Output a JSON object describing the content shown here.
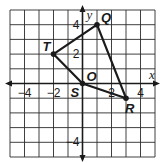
{
  "diagram": {
    "type": "coordinate-grid",
    "grid": {
      "xmin": -5,
      "xmax": 5,
      "ymin": -5,
      "ymax": 5,
      "step": 1
    },
    "axes": {
      "x_label": "x",
      "y_label": "y",
      "origin_label": "O"
    },
    "ticks": {
      "x": [
        {
          "value": -4,
          "label": "−4"
        },
        {
          "value": -2,
          "label": "−2"
        },
        {
          "value": 2,
          "label": "2"
        },
        {
          "value": 4,
          "label": "4"
        }
      ],
      "y": [
        {
          "value": 4,
          "label": "4"
        },
        {
          "value": 2,
          "label": "2"
        },
        {
          "value": -4,
          "label": "−4"
        }
      ]
    },
    "points": [
      {
        "name": "Q",
        "x": 1,
        "y": 4
      },
      {
        "name": "T",
        "x": -2,
        "y": 2
      },
      {
        "name": "S",
        "x": 0,
        "y": 0
      },
      {
        "name": "R",
        "x": 3,
        "y": -1
      }
    ],
    "polygon": [
      "Q",
      "T",
      "S",
      "R"
    ],
    "colors": {
      "grid": "#2a2a2a",
      "line": "#1a1a1a",
      "background": "#ffffff"
    }
  }
}
